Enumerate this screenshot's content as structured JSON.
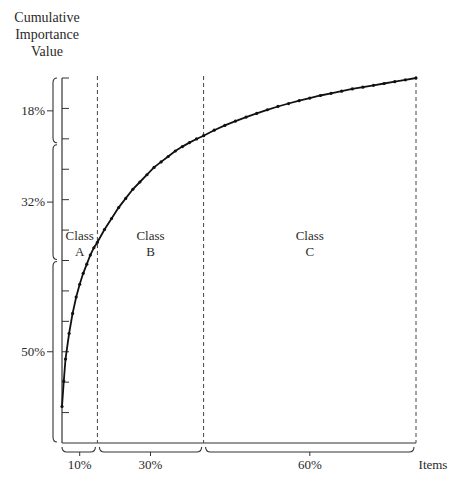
{
  "chart_data": {
    "type": "line",
    "title": "",
    "ylabel": [
      "Cumulative",
      "Importance",
      "Value"
    ],
    "xlabel": "Items",
    "x_range": [
      0,
      100
    ],
    "y_range": [
      0,
      100
    ],
    "y_tick_count": 12,
    "y_bracket_labels": [
      {
        "label": "18%",
        "from": 82,
        "to": 100
      },
      {
        "label": "32%",
        "from": 50,
        "to": 82
      },
      {
        "label": "50%",
        "from": 0,
        "to": 50
      }
    ],
    "x_bracket_labels": [
      {
        "label": "10%",
        "from": 0,
        "to": 10
      },
      {
        "label": "30%",
        "from": 10,
        "to": 40
      },
      {
        "label": "60%",
        "from": 40,
        "to": 100
      }
    ],
    "class_dividers": [
      10,
      40,
      100
    ],
    "classes": [
      {
        "line1": "Class",
        "line2": "A",
        "x_center": 5
      },
      {
        "line1": "Class",
        "line2": "B",
        "x_center": 25
      },
      {
        "line1": "Class",
        "line2": "C",
        "x_center": 70
      }
    ],
    "series": [
      {
        "name": "Cumulative importance",
        "x": [
          0,
          0.5,
          1,
          2,
          3,
          4,
          5,
          6,
          7,
          8,
          9,
          10,
          12,
          14,
          16,
          18,
          20,
          22,
          24,
          26,
          28,
          30,
          32,
          34,
          36,
          38,
          40,
          43,
          46,
          49,
          52,
          55,
          58,
          61,
          64,
          67,
          70,
          73,
          76,
          79,
          82,
          85,
          88,
          91,
          94,
          97,
          100
        ],
        "y": [
          10,
          17,
          23,
          30,
          35.5,
          40,
          43.5,
          46.5,
          49,
          51.5,
          53.5,
          55,
          58.5,
          61.5,
          64.5,
          67,
          69.5,
          71.5,
          73.5,
          75.5,
          77,
          78.5,
          80,
          81.2,
          82.3,
          83.3,
          84.2,
          85.7,
          87,
          88.2,
          89.3,
          90.3,
          91.3,
          92.2,
          93,
          93.8,
          94.5,
          95.2,
          95.8,
          96.4,
          97,
          97.5,
          98,
          98.5,
          99,
          99.5,
          100
        ]
      }
    ],
    "grid": false
  }
}
